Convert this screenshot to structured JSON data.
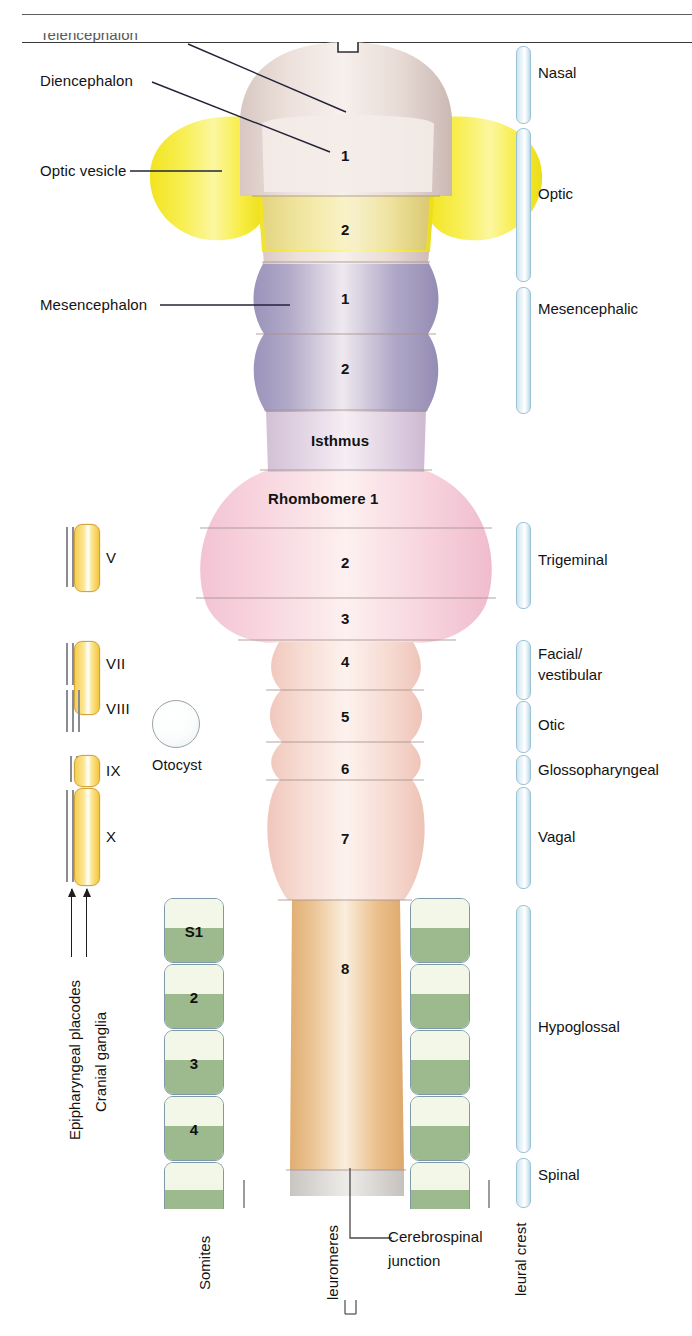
{
  "figure": {
    "title_clipped": "Telencephalon",
    "top_rule": true
  },
  "left_labels": [
    {
      "name": "telencephalon",
      "text": "Telencephalon",
      "clipped": true
    },
    {
      "name": "diencephalon",
      "text": "Diencephalon"
    },
    {
      "name": "optic-vesicle",
      "text": "Optic vesicle"
    },
    {
      "name": "mesencephalon",
      "text": "Mesencephalon"
    }
  ],
  "neural_tube": {
    "prosencephalon": [
      {
        "label": "1",
        "region": "prosomere"
      },
      {
        "label": "2",
        "region": "prosomere"
      }
    ],
    "mesencephalon": [
      {
        "label": "1",
        "region": "mesomere"
      },
      {
        "label": "2",
        "region": "mesomere"
      }
    ],
    "isthmus": {
      "label": "Isthmus"
    },
    "rhombomeres": [
      {
        "label": "Rhombomere 1"
      },
      {
        "label": "2"
      },
      {
        "label": "3"
      },
      {
        "label": "4"
      },
      {
        "label": "5"
      },
      {
        "label": "6"
      },
      {
        "label": "7"
      },
      {
        "label": "8"
      }
    ]
  },
  "cranial_ganglia": [
    {
      "roman": "V"
    },
    {
      "roman": "VII"
    },
    {
      "roman": "VIII"
    },
    {
      "roman": "IX"
    },
    {
      "roman": "X"
    }
  ],
  "left_axis": {
    "epipharyngeal_placodes": "Epipharyngeal placodes",
    "cranial_ganglia": "Cranial ganglia"
  },
  "otocyst": {
    "label": "Otocyst"
  },
  "somites": {
    "axis_label": "Somites",
    "items": [
      {
        "label": "S1"
      },
      {
        "label": "2"
      },
      {
        "label": "3"
      },
      {
        "label": "4"
      },
      {
        "label": ""
      }
    ]
  },
  "neuromeres_axis": {
    "label": "Neuromeres",
    "clipped_text": "leuromeres"
  },
  "cerebrospinal_junction": {
    "label_line1": "Cerebrospinal",
    "label_line2": "junction"
  },
  "neural_crest": {
    "axis_label": "Neural crest",
    "clipped_text": "leural crest",
    "segments": [
      {
        "label": "Nasal"
      },
      {
        "label": "Optic"
      },
      {
        "label": "Mesencephalic"
      },
      {
        "label": "Trigeminal"
      },
      {
        "label": "Facial/\nvestibular",
        "line1": "Facial/",
        "line2": "vestibular"
      },
      {
        "label": "Otic"
      },
      {
        "label": "Glossopharyngeal"
      },
      {
        "label": "Vagal"
      },
      {
        "label": "Hypoglossal"
      },
      {
        "label": "Spinal"
      }
    ]
  },
  "colors": {
    "prosencephalon": "#efe2dc",
    "optic_vesicle": "#f6ec2a",
    "mesencephalon": "#a9a3c4",
    "isthmus": "#d9cbdd",
    "rhombomere_rostral": "#f6d2dd",
    "rhombomere_caudal": "#f7ddd6",
    "spinal_cord": "#e8c193",
    "somite_green": "#9cba8e",
    "ganglion_yellow": "#f6cf52",
    "crest_blue": "#cfe5ef",
    "rule": "#5d5d5d"
  }
}
